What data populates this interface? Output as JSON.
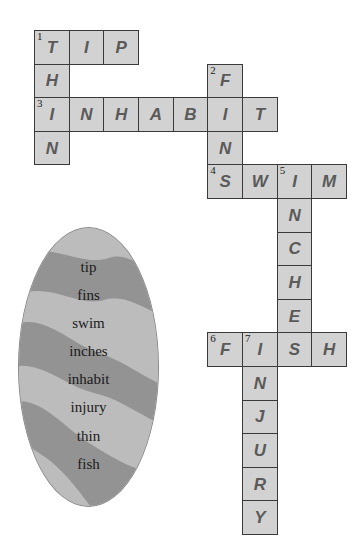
{
  "puzzle": {
    "type": "crossword",
    "grid_origin": {
      "x": 34,
      "y": 30
    },
    "cell_size": {
      "w": 34.67,
      "h": 33.6
    },
    "colors": {
      "cell_fill": "#d2d2d2",
      "cell_border": "#3a3a3a",
      "letter": "#5a5a5a",
      "oval_light": "#bcbcbc",
      "oval_dark": "#939393"
    },
    "cells": [
      {
        "col": 0,
        "row": 0,
        "letter": "T",
        "num": "1"
      },
      {
        "col": 1,
        "row": 0,
        "letter": "I"
      },
      {
        "col": 2,
        "row": 0,
        "letter": "P"
      },
      {
        "col": 0,
        "row": 1,
        "letter": "H"
      },
      {
        "col": 5,
        "row": 1,
        "letter": "F",
        "num": "2"
      },
      {
        "col": 0,
        "row": 2,
        "letter": "I",
        "num": "3"
      },
      {
        "col": 1,
        "row": 2,
        "letter": "N"
      },
      {
        "col": 2,
        "row": 2,
        "letter": "H"
      },
      {
        "col": 3,
        "row": 2,
        "letter": "A"
      },
      {
        "col": 4,
        "row": 2,
        "letter": "B"
      },
      {
        "col": 5,
        "row": 2,
        "letter": "I"
      },
      {
        "col": 6,
        "row": 2,
        "letter": "T"
      },
      {
        "col": 0,
        "row": 3,
        "letter": "N"
      },
      {
        "col": 5,
        "row": 3,
        "letter": "N"
      },
      {
        "col": 5,
        "row": 4,
        "letter": "S",
        "num": "4"
      },
      {
        "col": 6,
        "row": 4,
        "letter": "W"
      },
      {
        "col": 7,
        "row": 4,
        "letter": "I",
        "num": "5"
      },
      {
        "col": 8,
        "row": 4,
        "letter": "M"
      },
      {
        "col": 7,
        "row": 5,
        "letter": "N"
      },
      {
        "col": 7,
        "row": 6,
        "letter": "C"
      },
      {
        "col": 7,
        "row": 7,
        "letter": "H"
      },
      {
        "col": 7,
        "row": 8,
        "letter": "E"
      },
      {
        "col": 5,
        "row": 9,
        "letter": "F",
        "num": "6"
      },
      {
        "col": 6,
        "row": 9,
        "letter": "I",
        "num": "7"
      },
      {
        "col": 7,
        "row": 9,
        "letter": "S"
      },
      {
        "col": 8,
        "row": 9,
        "letter": "H"
      },
      {
        "col": 6,
        "row": 10,
        "letter": "N"
      },
      {
        "col": 6,
        "row": 11,
        "letter": "J"
      },
      {
        "col": 6,
        "row": 12,
        "letter": "U"
      },
      {
        "col": 6,
        "row": 13,
        "letter": "R"
      },
      {
        "col": 6,
        "row": 14,
        "letter": "Y"
      }
    ],
    "answers": {
      "across": [
        {
          "num": "1",
          "word": "TIP"
        },
        {
          "num": "3",
          "word": "INHABIT"
        },
        {
          "num": "4",
          "word": "SWIM"
        },
        {
          "num": "6",
          "word": "FISH"
        }
      ],
      "down": [
        {
          "num": "1",
          "word": "THIN"
        },
        {
          "num": "2",
          "word": "FINS"
        },
        {
          "num": "5",
          "word": "INCHES"
        },
        {
          "num": "7",
          "word": "INJURY"
        }
      ]
    }
  },
  "word_bank": {
    "words": [
      "tip",
      "fins",
      "swim",
      "inches",
      "inhabit",
      "injury",
      "thin",
      "fish"
    ]
  }
}
